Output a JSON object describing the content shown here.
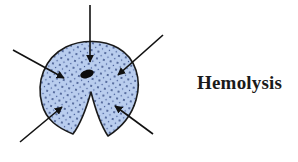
{
  "diagram": {
    "label": "Hemolysis",
    "colors": {
      "cell_fill": "#b9cdee",
      "cell_stroke": "#1a1a1a",
      "stipple": "#2a3f7a",
      "arrow": "#111111",
      "nucleus": "#0d0d0d",
      "text": "#1a1a1a"
    },
    "cell": {
      "shape": "ruptured-round-cell-with-notch",
      "nucleus": "dark-ellipse"
    },
    "arrows": [
      {
        "name": "top",
        "from": [
          90,
          5
        ],
        "to": [
          90,
          62
        ]
      },
      {
        "name": "upper-left",
        "from": [
          13,
          50
        ],
        "to": [
          64,
          78
        ]
      },
      {
        "name": "upper-right",
        "from": [
          163,
          35
        ],
        "to": [
          118,
          75
        ]
      },
      {
        "name": "lower-left",
        "from": [
          20,
          142
        ],
        "to": [
          62,
          107
        ]
      },
      {
        "name": "lower-right",
        "from": [
          153,
          134
        ],
        "to": [
          115,
          106
        ]
      }
    ]
  }
}
